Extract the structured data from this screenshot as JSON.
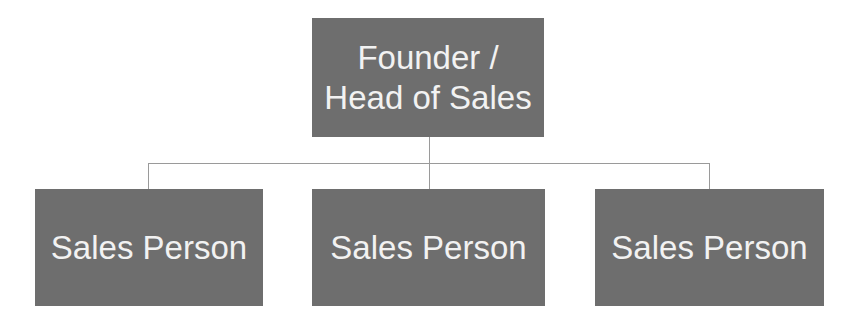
{
  "chart": {
    "type": "org-chart",
    "root": {
      "label_line1": "Founder /",
      "label_line2": "Head of Sales"
    },
    "children": [
      {
        "label": "Sales Person"
      },
      {
        "label": "Sales Person"
      },
      {
        "label": "Sales Person"
      }
    ],
    "colors": {
      "box": "#6e6e6e",
      "text": "#f2f2f2",
      "connector": "#9a9a9a",
      "background": "#ffffff"
    }
  }
}
